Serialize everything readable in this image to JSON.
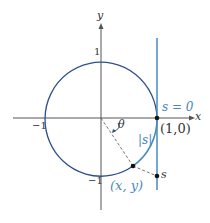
{
  "labels": {
    "y_axis": "y",
    "x_axis": "x",
    "tick_y_pos": "1",
    "tick_y_neg": "−1",
    "tick_x_neg": "−1",
    "theta": "θ",
    "s_zero": "s = 0",
    "point_10": "(1,0)",
    "abs_s": "|s|",
    "point_xy": "(x, y)",
    "s": "s"
  },
  "colors": {
    "circle": "#2f4f8a",
    "line": "#4a88c0",
    "axis": "#555555"
  }
}
